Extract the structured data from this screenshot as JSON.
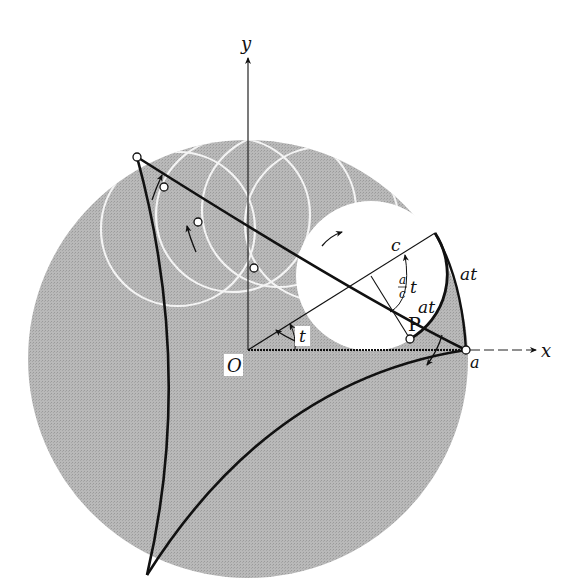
{
  "figure": {
    "colors": {
      "disk": "#b4b4b4",
      "rolling_circle": "#ffffff",
      "curve": "#111111",
      "ghost_circles": "#f2f2f2"
    }
  },
  "axes": {
    "x_label": "x",
    "y_label": "y",
    "origin_label": "O"
  },
  "labels": {
    "a": "a",
    "c": "c",
    "t": "t",
    "ratio_num": "a",
    "ratio_den": "c",
    "ratio_t": "t",
    "arc_outer": "at",
    "arc_inner": "at",
    "point": "P"
  }
}
